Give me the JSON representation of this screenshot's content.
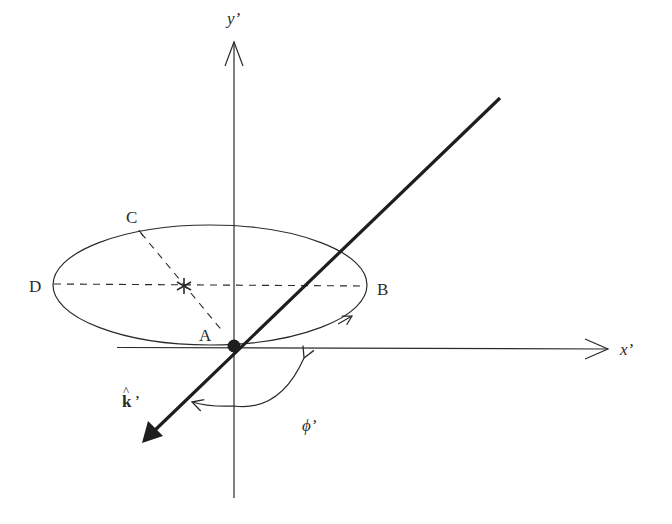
{
  "diagram": {
    "type": "geometry",
    "colors": {
      "ink": "#2a2a2a",
      "thick_line": "#1e1e1e",
      "background": "#ffffff"
    },
    "axes": {
      "x_label": "x’",
      "y_label": "y’"
    },
    "points": {
      "A": "A",
      "B": "B",
      "C": "C",
      "D": "D",
      "focus_marker": "*"
    },
    "vector_label": "k̂’",
    "vector_label_base": "k",
    "vector_label_hat": "^",
    "vector_label_prime": "’",
    "angle_label": "ϕ’",
    "geometry": {
      "origin": [
        234,
        346
      ],
      "ellipse": {
        "cx": 210,
        "cy": 285,
        "rx": 157,
        "ry": 60
      },
      "x_axis": {
        "from": [
          117,
          348
        ],
        "to": [
          608,
          349
        ]
      },
      "y_axis": {
        "from": [
          234,
          498
        ],
        "to": [
          234,
          42
        ]
      },
      "line_of_sight": {
        "from": [
          500,
          98
        ],
        "to": [
          142,
          443
        ]
      }
    }
  }
}
